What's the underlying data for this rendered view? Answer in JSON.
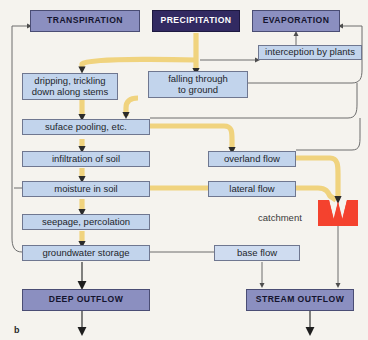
{
  "figure": {
    "label": "b",
    "caption_catchment": "catchment"
  },
  "colors": {
    "background": "#f5f3ee",
    "process_box": "#c2d4ec",
    "header_box": "#8b8fc0",
    "precipitation_box": "#322a62",
    "catchment_red": "#f4422e",
    "main_flow": "#f0d37e",
    "thin_arrow": "#5a5a5a"
  },
  "nodes": {
    "transpiration": {
      "label": "TRANSPIRATION",
      "type": "header"
    },
    "precipitation": {
      "label": "PRECIPITATION",
      "type": "header-dark"
    },
    "evaporation": {
      "label": "EVAPORATION",
      "type": "header"
    },
    "interception": {
      "label": "interception by plants",
      "type": "process"
    },
    "dripping": {
      "label": "dripping, trickling\ndown along stems",
      "line1": "dripping, trickling",
      "line2": "down along stems",
      "type": "process"
    },
    "falling": {
      "label": "falling through\nto ground",
      "line1": "falling through",
      "line2": "to ground",
      "type": "process"
    },
    "pooling": {
      "label": "suface pooling, etc.",
      "type": "process"
    },
    "infiltration": {
      "label": "infiltration of soil",
      "type": "process"
    },
    "moisture": {
      "label": "moisture in soil",
      "type": "process"
    },
    "seepage": {
      "label": "seepage, percolation",
      "type": "process"
    },
    "groundwater": {
      "label": "groundwater storage",
      "type": "process"
    },
    "overland": {
      "label": "overland flow",
      "type": "process"
    },
    "lateral": {
      "label": "lateral flow",
      "type": "process"
    },
    "baseflow": {
      "label": "base flow",
      "type": "process"
    },
    "deep_outflow": {
      "label": "DEEP OUTFLOW",
      "type": "header"
    },
    "stream_outflow": {
      "label": "STREAM OUTFLOW",
      "type": "header"
    }
  }
}
